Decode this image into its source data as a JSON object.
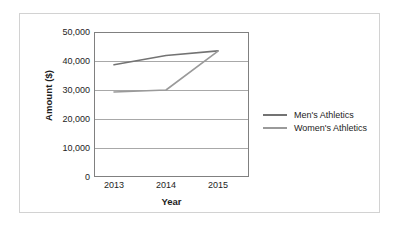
{
  "chart_data": {
    "type": "line",
    "title": "",
    "xlabel": "Year",
    "ylabel": "Amount ($)",
    "categories": [
      "2013",
      "2014",
      "2015"
    ],
    "x": [
      2013,
      2014,
      2015
    ],
    "series": [
      {
        "name": "Men's Athletics",
        "values": [
          38700,
          41900,
          43500
        ],
        "color": "#737373"
      },
      {
        "name": "Women's Athletics",
        "values": [
          29300,
          30000,
          43400
        ],
        "color": "#9a9a9a"
      }
    ],
    "ylim": [
      0,
      50000
    ],
    "yticks": [
      0,
      10000,
      20000,
      30000,
      40000,
      50000
    ],
    "ytick_labels": [
      "0",
      "10,000",
      "20,000",
      "30,000",
      "40,000",
      "50,000"
    ],
    "xtick_labels": [
      "2013",
      "2014",
      "2015"
    ],
    "grid": "horizontal",
    "legend_position": "right",
    "axis_color": "#808080",
    "grid_color": "#a8a8a8",
    "frame_color": "#d2d2d2",
    "background": "#ffffff"
  }
}
